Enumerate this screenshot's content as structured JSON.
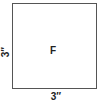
{
  "diagram": {
    "shape": "square",
    "center_label": "F",
    "left_side_label": "3″",
    "bottom_side_label": "3″",
    "stroke_color": "#555555",
    "text_color": "#222222"
  }
}
